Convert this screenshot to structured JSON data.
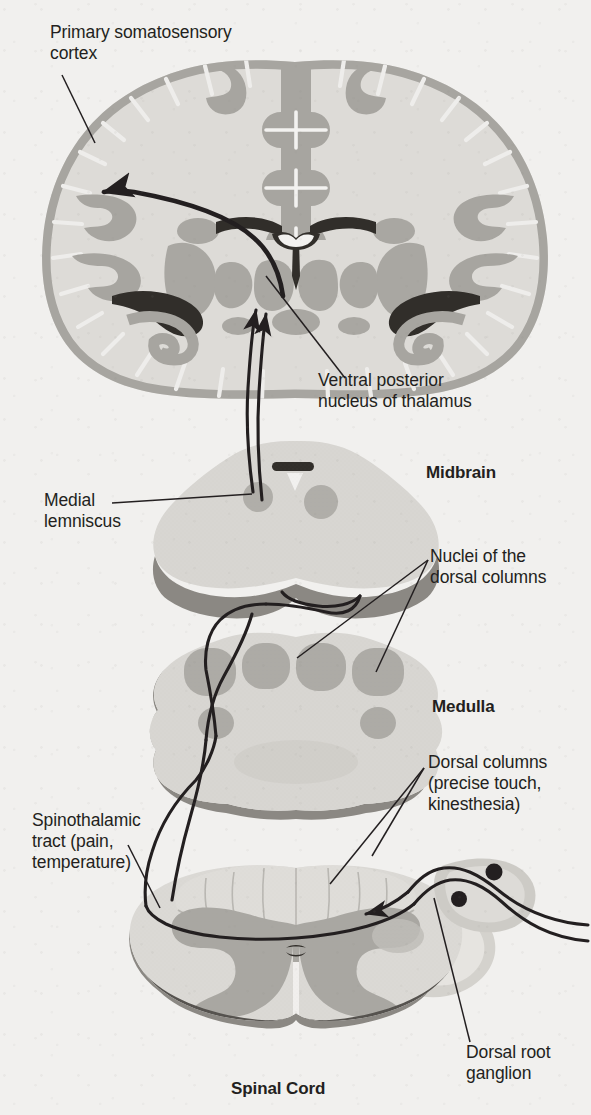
{
  "figure": {
    "background_color": "#f1f0ee"
  },
  "palette": {
    "ink": "#231f20",
    "background": "#f1f0ee",
    "white_matter": "#dedcd8",
    "gray_matter": "#a9a7a2",
    "gray_matter_light": "#c3c1bc",
    "nucleus_gray": "#b3b1ac",
    "ventricle_dark": "#3a3733",
    "shadow_band": "#8b8883",
    "section_fill": "#d9d7d3",
    "ganglion_fill": "#cfcdc8",
    "cell_body": "#231f20"
  },
  "labels": {
    "somatosensory_cortex": "Primary somatosensory\ncortex",
    "vp_nucleus": "Ventral posterior\nnucleus of thalamus",
    "medial_lemniscus": "Medial\nlemniscus",
    "nuclei_dorsal_columns": "Nuclei of the\ndorsal columns",
    "dorsal_columns": "Dorsal columns\n(precise touch,\nkinesthesia)",
    "spinothalamic_tract": "Spinothalamic\ntract (pain,\ntemperature)",
    "dorsal_root_ganglion": "Dorsal root\nganglion"
  },
  "section_titles": {
    "midbrain": "Midbrain",
    "medulla": "Medulla",
    "spinal_cord": "Spinal Cord"
  },
  "structures": [
    {
      "name": "cerebrum-coronal-section",
      "region": "forebrain"
    },
    {
      "name": "midbrain-section",
      "region": "brainstem"
    },
    {
      "name": "medulla-section",
      "region": "brainstem"
    },
    {
      "name": "spinal-cord-section",
      "region": "spinal cord"
    },
    {
      "name": "dorsal-root-ganglion",
      "region": "peripheral"
    }
  ],
  "pathways": [
    {
      "name": "dorsal-column-medial-lemniscal",
      "modality": "precise touch, kinesthesia"
    },
    {
      "name": "spinothalamic",
      "modality": "pain, temperature"
    },
    {
      "name": "thalamocortical",
      "modality": "thalamus to cortex"
    }
  ]
}
